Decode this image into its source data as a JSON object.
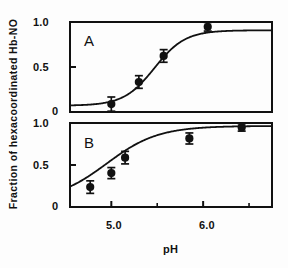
{
  "figure": {
    "xlabel": "pH",
    "ylabel": "Fraction of hexacoordinated  Hb-NO",
    "background_color": "#ffffff",
    "ink_color": "#111111"
  },
  "axis": {
    "x_tick_labels": [
      "5.0",
      "6.0"
    ],
    "x_tick_values": [
      5.0,
      6.0
    ],
    "x_minor_ticks": [
      5.5,
      6.5
    ],
    "y_tick_labels_panel_a": [
      "1.0",
      "0.5",
      "0"
    ],
    "y_tick_labels_panel_b": [
      "1.0",
      "0.5",
      "0"
    ]
  },
  "panels": [
    {
      "letter": "A",
      "marker_color": "#111111"
    },
    {
      "letter": "B",
      "marker_color": "#111111"
    }
  ],
  "chart_data": [
    {
      "type": "scatter",
      "title": "A",
      "xlabel": "pH",
      "ylabel": "Fraction of hexacoordinated Hb-NO",
      "xlim": [
        4.55,
        6.75
      ],
      "ylim": [
        -0.08,
        1.06
      ],
      "grid": false,
      "legend": "none",
      "series": [
        {
          "name": "Panel A data points",
          "marker": "filled-circle",
          "error_bars": "y",
          "x": [
            5.0,
            5.3,
            5.57,
            6.05
          ],
          "y": [
            0.02,
            0.3,
            0.63,
            1.0
          ],
          "yerr": [
            0.09,
            0.08,
            0.08,
            0.055
          ]
        },
        {
          "name": "Panel A fitted sigmoid curve",
          "marker": "none",
          "style": "solid-line",
          "fit": "sigmoid",
          "midpoint_pH": 5.47,
          "slope": 2.6,
          "plateau": 0.955
        }
      ]
    },
    {
      "type": "scatter",
      "title": "B",
      "xlabel": "pH",
      "ylabel": "Fraction of hexacoordinated Hb-NO",
      "xlim": [
        4.55,
        6.75
      ],
      "ylim": [
        -0.08,
        1.06
      ],
      "grid": false,
      "legend": "none",
      "series": [
        {
          "name": "Panel B data points",
          "marker": "filled-circle",
          "error_bars": "y",
          "x": [
            4.77,
            5.0,
            5.15,
            5.85,
            6.42
          ],
          "y": [
            0.19,
            0.38,
            0.59,
            0.85,
            1.0
          ],
          "yerr": [
            0.085,
            0.075,
            0.085,
            0.075,
            0.05
          ]
        },
        {
          "name": "Panel B fitted curve",
          "marker": "none",
          "style": "solid-line",
          "fit": "sigmoid",
          "midpoint_pH": 4.95,
          "slope": 1.55,
          "plateau": 1.02
        }
      ]
    }
  ]
}
